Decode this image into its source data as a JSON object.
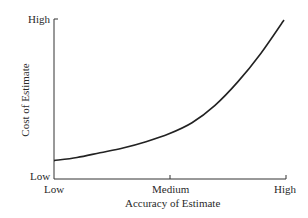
{
  "chart_data": {
    "type": "line",
    "title": "",
    "xlabel": "Accuracy of Estimate",
    "ylabel": "Cost of Estimate",
    "x_ticks": [
      "Low",
      "Medium",
      "High"
    ],
    "y_ticks": [
      "Low",
      "High"
    ],
    "series": [
      {
        "name": "Cost vs Accuracy",
        "x": [
          0,
          0.1,
          0.2,
          0.3,
          0.4,
          0.5,
          0.6,
          0.7,
          0.8,
          0.9,
          1.0
        ],
        "y": [
          0.11,
          0.13,
          0.16,
          0.19,
          0.23,
          0.28,
          0.35,
          0.46,
          0.61,
          0.79,
          1.0
        ]
      }
    ],
    "xlim": [
      0,
      1
    ],
    "ylim": [
      0,
      1
    ],
    "grid": false,
    "legend": "none"
  },
  "labels": {
    "y_high": "High",
    "y_low": "Low",
    "x_low": "Low",
    "x_medium": "Medium",
    "x_high": "High",
    "x_axis_title": "Accuracy of Estimate",
    "y_axis_title": "Cost of Estimate"
  }
}
